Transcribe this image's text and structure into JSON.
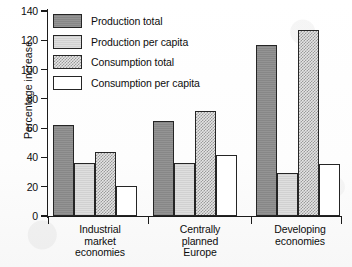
{
  "chart_data": {
    "type": "bar",
    "title": "",
    "xlabel": "",
    "ylabel": "Percentage increase",
    "ylim": [
      0,
      140
    ],
    "ytick_step": 20,
    "yticks": [
      0,
      20,
      40,
      60,
      80,
      100,
      120,
      140
    ],
    "grid": false,
    "legend_position": "top-left inside plot",
    "categories": [
      "Industrial market economies",
      "Centrally planned Europe",
      "Developing economies"
    ],
    "category_lines": [
      [
        "Industrial",
        "market",
        "economies"
      ],
      [
        "Centrally",
        "planned",
        "Europe"
      ],
      [
        "Developing",
        "economies"
      ]
    ],
    "series": [
      {
        "name": "Production total",
        "fill": "dark-gray-solid",
        "color": "#8e8e8e",
        "values": [
          62,
          65,
          117
        ]
      },
      {
        "name": "Production per capita",
        "fill": "light-gray-solid",
        "color": "#d8d8d8",
        "values": [
          36,
          36.5,
          29.5
        ]
      },
      {
        "name": "Consumption total",
        "fill": "checkered-gray",
        "color": "#9a9a9a",
        "values": [
          43.5,
          72,
          127
        ]
      },
      {
        "name": "Consumption per capita",
        "fill": "white-outline",
        "color": "#ffffff",
        "values": [
          20.5,
          42,
          35.5
        ]
      }
    ]
  }
}
